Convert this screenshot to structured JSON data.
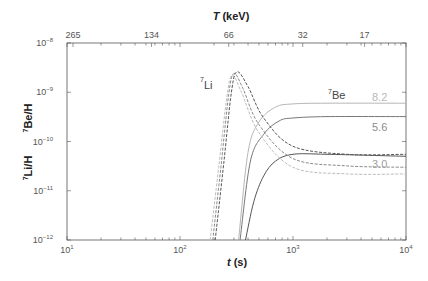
{
  "chart_data": {
    "type": "line",
    "title": "",
    "xlabel": "t (s)",
    "xlabel_italic_part": "t",
    "xlabel_unit": " (s)",
    "x2label": "T (keV)",
    "x2label_italic_part": "T",
    "x2label_unit": " (keV)",
    "ylabel_left": "7Li/H",
    "ylabel_right": "7Be/H",
    "xscale": "log",
    "yscale": "log",
    "xlim": [
      10,
      10000
    ],
    "ylim": [
      1e-12,
      1e-08
    ],
    "grid": false,
    "x_ticks": [
      {
        "base": "10",
        "exp": "1",
        "value": 10
      },
      {
        "base": "10",
        "exp": "2",
        "value": 100
      },
      {
        "base": "10",
        "exp": "3",
        "value": 1000
      },
      {
        "base": "10",
        "exp": "4",
        "value": 10000
      }
    ],
    "y_ticks": [
      {
        "base": "10",
        "exp": "−8",
        "value": 1e-08
      },
      {
        "base": "10",
        "exp": "−9",
        "value": 1e-09
      },
      {
        "base": "10",
        "exp": "−10",
        "value": 1e-10
      },
      {
        "base": "10",
        "exp": "−11",
        "value": 1e-11
      },
      {
        "base": "10",
        "exp": "−12",
        "value": 1e-12
      }
    ],
    "x2_ticks": [
      {
        "label": "265",
        "t": 11.3
      },
      {
        "label": "134",
        "t": 56
      },
      {
        "label": "66",
        "t": 270
      },
      {
        "label": "32",
        "t": 1220
      },
      {
        "label": "17",
        "t": 4300
      }
    ],
    "annotations": [
      {
        "text": "7Li",
        "sup": "7",
        "sub": "Li"
      },
      {
        "text": "7Be",
        "sup": "7",
        "sub": "Be"
      },
      {
        "text": "8.2",
        "color": "#b8b8b8"
      },
      {
        "text": "5.6",
        "color": "#8c8c8c"
      },
      {
        "text": "3.0",
        "color": "#a0a0a0"
      }
    ],
    "series": [
      {
        "name": "7Be eta=8.2",
        "style": "solid",
        "color": "#b5b5b5",
        "t": [
          330,
          400,
          500,
          700,
          1000,
          2000,
          10000
        ],
        "y": [
          1e-12,
          6e-11,
          2.5e-10,
          5e-10,
          5.8e-10,
          6e-10,
          6e-10
        ]
      },
      {
        "name": "7Be eta=5.6",
        "style": "solid",
        "color": "#777777",
        "t": [
          340,
          420,
          550,
          750,
          1000,
          2000,
          10000
        ],
        "y": [
          1e-12,
          4e-11,
          1.4e-10,
          2.6e-10,
          3e-10,
          3.2e-10,
          3.2e-10
        ]
      },
      {
        "name": "7Be eta=3.0",
        "style": "solid",
        "color": "#555555",
        "t": [
          380,
          450,
          550,
          700,
          1000,
          2000,
          10000
        ],
        "y": [
          1e-12,
          6e-12,
          2e-11,
          4e-11,
          5.5e-11,
          5.5e-11,
          5e-11
        ]
      },
      {
        "name": "7Li eta=8.2",
        "style": "dashed",
        "color": "#bdbdbd",
        "t": [
          185,
          220,
          260,
          290,
          350,
          500,
          1000,
          3000,
          10000
        ],
        "y": [
          1e-12,
          3e-11,
          8e-10,
          2.2e-09,
          1e-09,
          1.5e-10,
          3e-11,
          2.2e-11,
          2.2e-11
        ]
      },
      {
        "name": "7Li eta=5.6",
        "style": "dashed",
        "color": "#8a8a8a",
        "t": [
          195,
          230,
          270,
          300,
          360,
          500,
          1000,
          3000,
          10000
        ],
        "y": [
          1e-12,
          3e-11,
          9e-10,
          2.4e-09,
          1.2e-09,
          2.2e-10,
          4.5e-11,
          3.2e-11,
          3e-11
        ]
      },
      {
        "name": "7Li eta=3.0",
        "style": "dashed",
        "color": "#555555",
        "t": [
          205,
          245,
          285,
          320,
          400,
          550,
          1000,
          3000,
          10000
        ],
        "y": [
          1e-12,
          4e-11,
          1e-09,
          2.6e-09,
          1.3e-09,
          3e-10,
          8e-11,
          5.5e-11,
          5.5e-11
        ]
      }
    ]
  }
}
